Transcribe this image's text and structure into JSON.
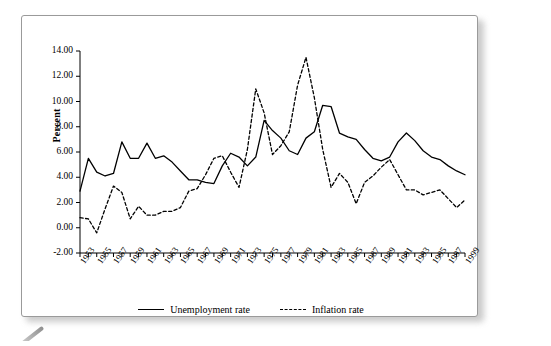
{
  "figure": {
    "y_axis_title": "Percent"
  },
  "legend": {
    "position": "bottom-center",
    "entries": [
      {
        "label": "Unemployment rate",
        "style": "solid"
      },
      {
        "label": "Inflation rate",
        "style": "dashed"
      }
    ]
  },
  "chart_data": {
    "type": "line",
    "title": "",
    "subtitle": "",
    "xlabel": "",
    "ylabel": "Percent",
    "xlim": [
      1953,
      1999
    ],
    "ylim": [
      -2.0,
      14.0
    ],
    "y_tick_step": 2.0,
    "x_tick_step": 1,
    "x_label_step": 2,
    "grid": false,
    "y_ticks": [
      "-2.00",
      "0.00",
      "2.00",
      "4.00",
      "6.00",
      "8.00",
      "10.00",
      "12.00",
      "14.00"
    ],
    "x_ticks": [
      "1953",
      "1955",
      "1957",
      "1959",
      "1961",
      "1963",
      "1965",
      "1967",
      "1969",
      "1971",
      "1973",
      "1975",
      "1977",
      "1979",
      "1981",
      "1983",
      "1985",
      "1987",
      "1989",
      "1991",
      "1993",
      "1995",
      "1997",
      "1999"
    ],
    "x": [
      1953,
      1954,
      1955,
      1956,
      1957,
      1958,
      1959,
      1960,
      1961,
      1962,
      1963,
      1964,
      1965,
      1966,
      1967,
      1968,
      1969,
      1970,
      1971,
      1972,
      1973,
      1974,
      1975,
      1976,
      1977,
      1978,
      1979,
      1980,
      1981,
      1982,
      1983,
      1984,
      1985,
      1986,
      1987,
      1988,
      1989,
      1990,
      1991,
      1992,
      1993,
      1994,
      1995,
      1996,
      1997,
      1998,
      1999
    ],
    "series": [
      {
        "name": "Unemployment rate",
        "style": "solid",
        "color": "#000000",
        "values": [
          2.9,
          5.5,
          4.4,
          4.1,
          4.3,
          6.8,
          5.5,
          5.5,
          6.7,
          5.5,
          5.7,
          5.2,
          4.5,
          3.8,
          3.8,
          3.6,
          3.5,
          4.9,
          5.9,
          5.6,
          4.9,
          5.6,
          8.5,
          7.7,
          7.1,
          6.1,
          5.8,
          7.1,
          7.6,
          9.7,
          9.6,
          7.5,
          7.2,
          7.0,
          6.2,
          5.5,
          5.3,
          5.6,
          6.8,
          7.5,
          6.9,
          6.1,
          5.6,
          5.4,
          4.9,
          4.5,
          4.2
        ]
      },
      {
        "name": "Inflation rate",
        "style": "dashed",
        "color": "#000000",
        "values": [
          0.8,
          0.7,
          -0.4,
          1.5,
          3.3,
          2.8,
          0.7,
          1.7,
          1.0,
          1.0,
          1.3,
          1.3,
          1.6,
          2.9,
          3.1,
          4.2,
          5.5,
          5.7,
          4.4,
          3.2,
          6.2,
          11.0,
          9.1,
          5.8,
          6.5,
          7.6,
          11.3,
          13.5,
          10.3,
          6.2,
          3.2,
          4.3,
          3.6,
          1.9,
          3.6,
          4.1,
          4.8,
          5.4,
          4.2,
          3.0,
          3.0,
          2.6,
          2.8,
          3.0,
          2.3,
          1.6,
          2.2
        ]
      }
    ]
  }
}
